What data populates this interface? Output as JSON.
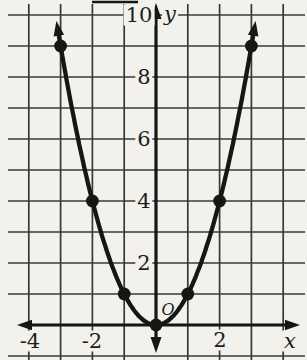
{
  "colors": {
    "background": "#f2f1ec",
    "ink": "#161616",
    "grid": "#383838",
    "text": "#1d1d1d"
  },
  "chart_data": {
    "type": "line",
    "title": "",
    "xlabel": "x",
    "ylabel": "y",
    "origin_label": "O",
    "xlim": [
      -4,
      4
    ],
    "ylim": [
      -1,
      10
    ],
    "grid": true,
    "x_axis_arrows": "both",
    "y_axis_arrows": "both",
    "series": [
      {
        "name": "parabola",
        "marker": "filled-dot",
        "arrow_ends": "both",
        "points": [
          [
            -3,
            9
          ],
          [
            -2,
            4
          ],
          [
            -1,
            1
          ],
          [
            0,
            0
          ],
          [
            1,
            1
          ],
          [
            2,
            4
          ],
          [
            3,
            9
          ]
        ]
      }
    ],
    "x_ticks": [
      {
        "value": -4,
        "label": "-4"
      },
      {
        "value": -2,
        "label": "-2"
      },
      {
        "value": 2,
        "label": "2"
      }
    ],
    "y_ticks": [
      {
        "value": 2,
        "label": "2"
      },
      {
        "value": 4,
        "label": "4"
      },
      {
        "value": 6,
        "label": "6"
      },
      {
        "value": 8,
        "label": "8"
      },
      {
        "value": 10,
        "label": "10"
      }
    ]
  }
}
